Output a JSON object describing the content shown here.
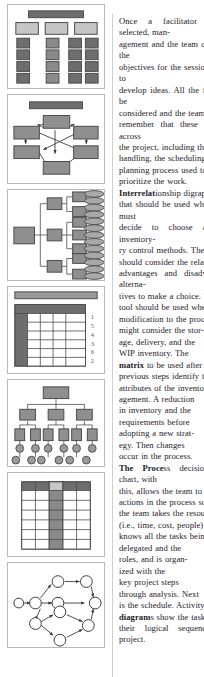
{
  "page": {
    "layout": "two-column book page: figure thumbnails left, body text right",
    "background_color": "#ffffff",
    "text_color": "#24201f"
  },
  "figures": {
    "panel_border_color": "#b9b9b9",
    "fill_dark": "#6e6e6e",
    "fill_mid": "#8a8a8a",
    "fill_light": "#c9c9c9",
    "line_color": "#3a3a3a",
    "items": [
      {
        "id": "panel-1",
        "name": "organization-chart-grid",
        "caption_text": "",
        "description": "top banner bar with three column headings and a grid of stacked boxes"
      },
      {
        "id": "panel-2",
        "name": "interrelationship-digraph",
        "caption_text": "",
        "description": "title bar above six boxes connected by crossing directional arrows"
      },
      {
        "id": "panel-3",
        "name": "tree-breakdown-diagram",
        "caption_text": "",
        "description": "left root box branching to three mid boxes, then leaf boxes, then stacked ellipses"
      },
      {
        "id": "panel-4",
        "name": "prioritization-matrix",
        "caption_text": "",
        "row_scores": [
          "1",
          "5",
          "4",
          "3",
          "6",
          "2"
        ],
        "description": "banner bar above a five column matrix with a dark header row, dark first column and numeric ranks at right"
      },
      {
        "id": "panel-5",
        "name": "work-breakdown-structure",
        "caption_text": "",
        "description": "top box over three boxes over six boxes over rows of circles"
      },
      {
        "id": "panel-6",
        "name": "responsibility-matrix",
        "caption_text": "",
        "description": "five column matrix with dark header row and one highlighted shaded column"
      },
      {
        "id": "panel-7",
        "name": "activity-network-diagram",
        "caption_text": "",
        "description": "circular nodes linked by arrows forming parallel paths through the network"
      }
    ]
  },
  "text": {
    "paragraph": "Once a facilitator has been selected, the team manages the objectives, identifying items to be considered, and remembers the project handling, planning priorities, and prioritizes.",
    "runs": [
      {
        "t": "Once a fac",
        "b": false
      },
      {
        "t": "\nagement a",
        "b": false
      },
      {
        "t": "\nobjectives",
        "b": false
      },
      {
        "t": "\ndevelop id",
        "b": false
      },
      {
        "t": "\nconsidered",
        "b": false
      },
      {
        "t": "\nremember",
        "b": false
      },
      {
        "t": "\nthe project",
        "b": false
      },
      {
        "t": "\nhandling,",
        "b": false
      },
      {
        "t": "\nplanning p",
        "b": false
      },
      {
        "t": "\nprioritize",
        "b": false
      },
      {
        "t": "\nInterrelat",
        "b": true
      },
      {
        "t": "\nthat should",
        "b": false
      },
      {
        "t": "\ndecide to c",
        "b": false
      },
      {
        "t": "\nry control",
        "b": false
      },
      {
        "t": "\nshould con",
        "b": false
      },
      {
        "t": "\nadvantage",
        "b": false
      },
      {
        "t": "\ntives to ma",
        "b": false
      },
      {
        "t": "\ntool shoul",
        "b": false
      },
      {
        "t": "\nmodificatio",
        "b": false
      },
      {
        "t": "\nmight cons",
        "b": false
      },
      {
        "t": "\nage, delive",
        "b": false
      },
      {
        "t": "\nWIP inven",
        "b": false
      },
      {
        "t": "\nmatrix",
        "b": true
      },
      {
        "t": " to",
        "b": false
      },
      {
        "t": "\nprevious s",
        "b": false
      },
      {
        "t": "\nattributes o",
        "b": false
      },
      {
        "t": "\nagement. A",
        "b": false
      },
      {
        "t": "\nin inventor",
        "b": false
      },
      {
        "t": "\nrequiremen",
        "b": false
      },
      {
        "t": "\nadopting a",
        "b": false
      },
      {
        "t": "\negy. Then",
        "b": false
      },
      {
        "t": "\noccur in th",
        "b": false
      },
      {
        "t": "\nThe ",
        "b": false
      },
      {
        "t": "Proce",
        "b": true
      },
      {
        "t": "\nthis, allow",
        "b": false
      },
      {
        "t": "\nactions in",
        "b": false
      },
      {
        "t": "\nthe team t",
        "b": false
      },
      {
        "t": "\n(i.e., time,",
        "b": false
      },
      {
        "t": "\nknows all",
        "b": false
      },
      {
        "t": "\ndelegated",
        "b": false
      },
      {
        "t": "\nroles, and",
        "b": false
      },
      {
        "t": "\nized with t",
        "b": false
      },
      {
        "t": "\nkey projec",
        "b": false
      },
      {
        "t": "\nthrough an",
        "b": false
      },
      {
        "t": "\nis the sch",
        "b": false
      },
      {
        "t": "\ndiagram",
        "b": true
      },
      {
        "t": "\ntheir logic",
        "b": false
      }
    ],
    "lines": [
      {
        "text": "Once a facilitator has been selected, man-",
        "bold_prefix": ""
      },
      {
        "text": "agement and the team can establish the",
        "bold_prefix": ""
      },
      {
        "text": "objectives for the session and begin to",
        "bold_prefix": ""
      },
      {
        "text": "develop ideas. All the factors must be",
        "bold_prefix": ""
      },
      {
        "text": "considered and the team needs to",
        "bold_prefix": ""
      },
      {
        "text": "remember that these tools apply across",
        "bold_prefix": ""
      },
      {
        "text": "the project, including the material",
        "bold_prefix": ""
      },
      {
        "text": "handling, the scheduling, and the",
        "bold_prefix": ""
      },
      {
        "text": "planning process used to",
        "bold_prefix": ""
      },
      {
        "text": "prioritize the work.",
        "bold_prefix": ""
      },
      {
        "text": "ionship digraphs are tools",
        "bold_prefix": "Interrelat"
      },
      {
        "text": "that should be used when the team must",
        "bold_prefix": ""
      },
      {
        "text": "decide to choose among the inventory-",
        "bold_prefix": ""
      },
      {
        "text": "ry control methods. The team",
        "bold_prefix": ""
      },
      {
        "text": "should consider the relative",
        "bold_prefix": ""
      },
      {
        "text": "advantages and disadvantages of alterna-",
        "bold_prefix": ""
      },
      {
        "text": "tives to make a choice. The",
        "bold_prefix": ""
      },
      {
        "text": "tool should be used when a",
        "bold_prefix": ""
      },
      {
        "text": "modification to the process",
        "bold_prefix": ""
      },
      {
        "text": "might consider the stor-",
        "bold_prefix": ""
      },
      {
        "text": "age, delivery, and the",
        "bold_prefix": ""
      },
      {
        "text": "WIP inventory. The",
        "bold_prefix": ""
      },
      {
        "text": " to be used after the",
        "bold_prefix": "matrix"
      },
      {
        "text": "previous steps identify the",
        "bold_prefix": ""
      },
      {
        "text": "attributes of the inventory man-",
        "bold_prefix": ""
      },
      {
        "text": "agement. A reduction",
        "bold_prefix": ""
      },
      {
        "text": "in inventory and the",
        "bold_prefix": ""
      },
      {
        "text": "requirements before",
        "bold_prefix": ""
      },
      {
        "text": "adopting a new strat-",
        "bold_prefix": ""
      },
      {
        "text": "egy. Then changes",
        "bold_prefix": ""
      },
      {
        "text": "occur in the process.",
        "bold_prefix": ""
      },
      {
        "text": "ss decision program chart, with",
        "bold_prefix": "The Proce"
      },
      {
        "text": "this, allows the team to plan the",
        "bold_prefix": ""
      },
      {
        "text": "actions in the process so that",
        "bold_prefix": ""
      },
      {
        "text": "the team takes the resources",
        "bold_prefix": ""
      },
      {
        "text": "(i.e., time, cost, people) and",
        "bold_prefix": ""
      },
      {
        "text": "knows all the tasks being",
        "bold_prefix": ""
      },
      {
        "text": "delegated and the",
        "bold_prefix": ""
      },
      {
        "text": "roles, and is organ-",
        "bold_prefix": ""
      },
      {
        "text": "ized with the",
        "bold_prefix": ""
      },
      {
        "text": "key project steps",
        "bold_prefix": ""
      },
      {
        "text": "through analysis. Next",
        "bold_prefix": ""
      },
      {
        "text": "is the schedule. Activity network",
        "bold_prefix": ""
      },
      {
        "text": "s show the tasks and",
        "bold_prefix": "diagram"
      },
      {
        "text": "their logical sequence in the project.",
        "bold_prefix": ""
      }
    ]
  }
}
